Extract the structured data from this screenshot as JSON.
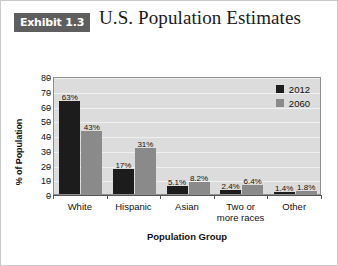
{
  "header": {
    "badge": "Exhibit 1.3",
    "title": "U.S. Population Estimates"
  },
  "chart_data": {
    "type": "bar",
    "title": "U.S. Population Estimates",
    "xlabel": "Population Group",
    "ylabel": "% of Population",
    "ylim": [
      0,
      80
    ],
    "yticks": [
      0,
      10,
      20,
      30,
      40,
      50,
      60,
      70,
      80
    ],
    "grid": true,
    "legend_position": "top-right",
    "categories": [
      "White",
      "Hispanic",
      "Asian",
      "Two or\nmore races",
      "Other"
    ],
    "category_labels": [
      {
        "line1": "White",
        "line2": ""
      },
      {
        "line1": "Hispanic",
        "line2": ""
      },
      {
        "line1": "Asian",
        "line2": ""
      },
      {
        "line1": "Two or",
        "line2": "more races"
      },
      {
        "line1": "Other",
        "line2": ""
      }
    ],
    "series": [
      {
        "name": "2012",
        "color": "#1c1c1c",
        "values": [
          63,
          17,
          5.1,
          2.4,
          1.4
        ],
        "data_labels": [
          "63%",
          "17%",
          "5.1%",
          "2.4%",
          "1.4%"
        ]
      },
      {
        "name": "2060",
        "color": "#8a8a8a",
        "values": [
          43,
          31,
          8.2,
          6.4,
          1.8
        ],
        "data_labels": [
          "43%",
          "31%",
          "8.2%",
          "6.4%",
          "1.8%"
        ]
      }
    ]
  },
  "colors": {
    "badge_background": "#5e5e5e",
    "plot_background": "#dcdcdc",
    "series_2012": "#1c1c1c",
    "series_2060": "#8a8a8a"
  }
}
